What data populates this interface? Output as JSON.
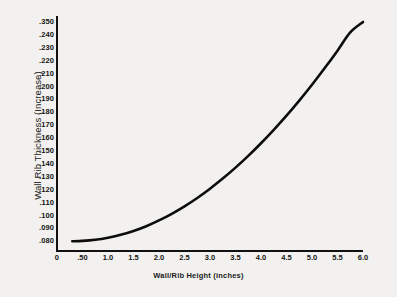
{
  "chart_data": {
    "type": "line",
    "title": "",
    "xlabel": "Wall/Rib Height (inches)",
    "ylabel": "Wall Rib Thickness (Increase)",
    "xlim": [
      0,
      6.0
    ],
    "ylim": [
      0.075,
      0.255
    ],
    "grid": false,
    "legend": "none",
    "x_tick_labels": [
      "0",
      ".50",
      "1.0",
      "1.5",
      "2.0",
      "2.5",
      "3.0",
      "3.5",
      "4.0",
      "4.5",
      "5.0",
      "5.5",
      "6.0"
    ],
    "x_tick_values": [
      0,
      0.5,
      1.0,
      1.5,
      2.0,
      2.5,
      3.0,
      3.5,
      4.0,
      4.5,
      5.0,
      5.5,
      6.0
    ],
    "y_tick_labels": [
      ".350",
      ".240",
      ".230",
      ".220",
      ".210",
      ".200",
      ".190",
      ".180",
      ".170",
      ".160",
      ".150",
      ".140",
      ".130",
      ".120",
      ".110",
      ".100",
      ".090",
      ".080"
    ],
    "y_tick_values": [
      0.25,
      0.24,
      0.23,
      0.22,
      0.21,
      0.2,
      0.19,
      0.18,
      0.17,
      0.16,
      0.15,
      0.14,
      0.13,
      0.12,
      0.11,
      0.1,
      0.09,
      0.08
    ],
    "series": [
      {
        "name": "Wall Rib Thickness vs Wall/Rib Height",
        "x": [
          0.3,
          0.5,
          0.75,
          1.0,
          1.25,
          1.5,
          1.75,
          2.0,
          2.25,
          2.5,
          2.75,
          3.0,
          3.25,
          3.5,
          3.75,
          4.0,
          4.25,
          4.5,
          4.75,
          5.0,
          5.25,
          5.5,
          5.75,
          6.0
        ],
        "y": [
          0.08,
          0.0803,
          0.0812,
          0.0828,
          0.085,
          0.088,
          0.0917,
          0.0962,
          0.1013,
          0.1071,
          0.1136,
          0.1208,
          0.1286,
          0.1371,
          0.1462,
          0.156,
          0.1664,
          0.1774,
          0.1891,
          0.2014,
          0.2143,
          0.2278,
          0.2419,
          0.25
        ],
        "color": "#0d0d0d",
        "line_width": 2.6
      }
    ]
  },
  "axes": {
    "x_title": "Wall/Rib Height (inches)",
    "y_title": "Wall Rib Thickness (Increase)"
  },
  "colors": {
    "background": "#f2f1ef",
    "axis": "#111111",
    "curve": "#0d0d0d",
    "text": "#141414"
  }
}
